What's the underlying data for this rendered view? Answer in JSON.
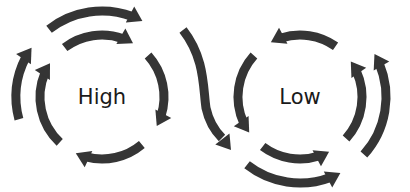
{
  "diagram": {
    "arrow_color": "#353535",
    "background": "#ffffff",
    "cycles": [
      {
        "id": "high",
        "label": "High",
        "center": [
          102,
          97
        ],
        "direction": "clockwise",
        "inner_radius": 62,
        "outer_radius": 86
      },
      {
        "id": "low",
        "label": "Low",
        "center": [
          300,
          97
        ],
        "direction": "counter-clockwise",
        "inner_radius": 62,
        "outer_radius": 86
      }
    ],
    "connector": {
      "description": "S-shaped arrow from the High cycle's outer ring down into the Low cycle's outer ring"
    }
  }
}
